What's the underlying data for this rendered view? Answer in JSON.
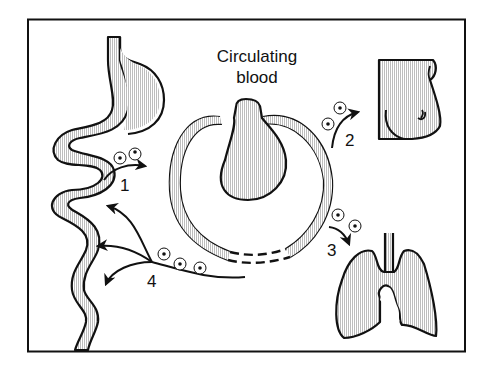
{
  "diagram": {
    "title_line1": "Circulating",
    "title_line2": "blood",
    "routes": [
      {
        "number": "1",
        "from": "circulating-blood",
        "to": "gastrointestinal-tract",
        "direction": "gut-to-blood"
      },
      {
        "number": "2",
        "from": "circulating-blood",
        "to": "breast",
        "direction": "blood-to-breast"
      },
      {
        "number": "3",
        "from": "circulating-blood",
        "to": "lungs",
        "direction": "blood-to-lungs"
      },
      {
        "number": "4",
        "from": "circulating-blood",
        "to": "gastrointestinal-tract",
        "direction": "blood-to-gut",
        "arrow_count": 3
      }
    ],
    "organs": [
      "stomach-and-intestine",
      "heart",
      "breast",
      "lungs"
    ],
    "colors": {
      "stroke": "#111111",
      "fill_hatch": "#c8c8c8",
      "background": "#ffffff"
    }
  }
}
